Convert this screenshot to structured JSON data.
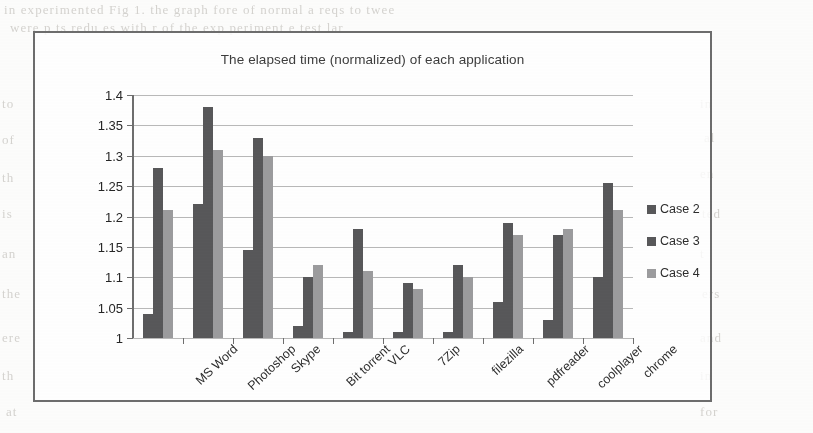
{
  "page": {
    "background_bleed_lines": [
      "in  experimented  Fig 1. the graph  fore of  normal  a  reqs   to    twee",
      "were  p   ts    redu  es  with   r    of the  exp   periment  e   test   lar",
      "in",
      "al",
      "en",
      "ted",
      "t",
      "ers",
      "to",
      "of",
      "th",
      "is",
      "an",
      "the",
      "ere",
      "th",
      "at",
      "and",
      "in",
      "for"
    ]
  },
  "figure": {
    "frame_color": "#6d6d6d"
  },
  "chart_data": {
    "type": "bar",
    "title": "The elapsed time (normalized) of each application",
    "xlabel": "",
    "ylabel": "",
    "ylim": [
      1,
      1.4
    ],
    "ytick_labels": [
      "1",
      "1.05",
      "1.1",
      "1.15",
      "1.2",
      "1.25",
      "1.3",
      "1.35",
      "1.4"
    ],
    "ytick_values": [
      1,
      1.05,
      1.1,
      1.15,
      1.2,
      1.25,
      1.3,
      1.35,
      1.4
    ],
    "grid": true,
    "legend_position": "right",
    "categories": [
      "MS Word",
      "Photoshop",
      "Skype",
      "Bit torrent",
      "VLC",
      "7Zip",
      "filezilla",
      "pdfreader",
      "coolplayer",
      "chrome"
    ],
    "series": [
      {
        "name": "Case 2",
        "color": "#58585a",
        "values": [
          1.04,
          1.22,
          1.145,
          1.02,
          1.01,
          1.01,
          1.01,
          1.06,
          1.03,
          1.1
        ]
      },
      {
        "name": "Case 3",
        "color": "#58585a",
        "values": [
          1.28,
          1.38,
          1.33,
          1.1,
          1.18,
          1.09,
          1.12,
          1.19,
          1.17,
          1.255
        ]
      },
      {
        "name": "Case 4",
        "color": "#9c9c9e",
        "values": [
          1.21,
          1.31,
          1.3,
          1.12,
          1.11,
          1.08,
          1.1,
          1.17,
          1.18,
          1.21
        ]
      }
    ]
  }
}
